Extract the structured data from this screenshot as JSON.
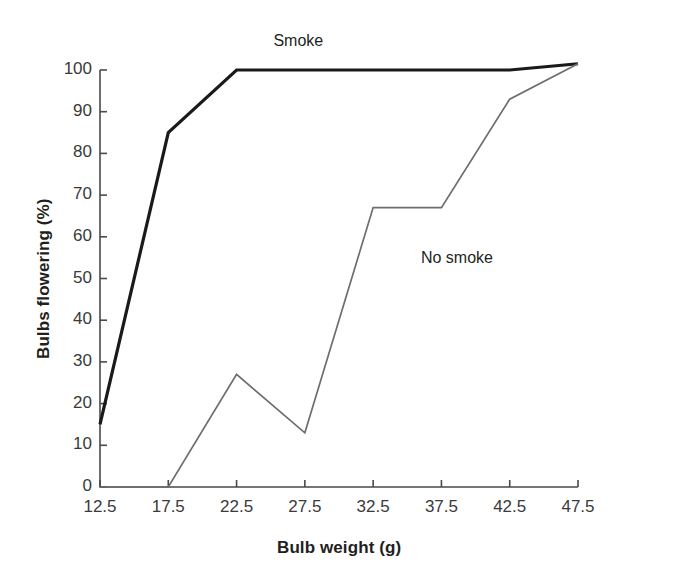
{
  "chart_data": {
    "type": "line",
    "title": "",
    "xlabel": "Bulb weight (g)",
    "ylabel": "Bulbs flowering (%)",
    "xlim": [
      12.5,
      47.5
    ],
    "ylim": [
      0,
      100
    ],
    "x": [
      12.5,
      17.5,
      22.5,
      27.5,
      32.5,
      37.5,
      42.5,
      47.5
    ],
    "xtick_labels": [
      "12.5",
      "17.5",
      "22.5",
      "27.5",
      "32.5",
      "37.5",
      "42.5",
      "47.5"
    ],
    "ytick_labels": [
      "0",
      "10",
      "20",
      "30",
      "40",
      "50",
      "60",
      "70",
      "80",
      "90",
      "100"
    ],
    "yticks": [
      0,
      10,
      20,
      30,
      40,
      50,
      60,
      70,
      80,
      90,
      100
    ],
    "grid": false,
    "legend_position": "inline-annotations",
    "series": [
      {
        "name": "Smoke",
        "color": "#1a1a1a",
        "width": 3.2,
        "values": [
          15,
          85,
          100,
          100,
          100,
          100,
          100,
          101.5
        ]
      },
      {
        "name": "No smoke",
        "color": "#6d6d70",
        "width": 1.7,
        "values": [
          0,
          0,
          27,
          13,
          67,
          67,
          93,
          101.5
        ]
      }
    ],
    "annotations": [
      {
        "text": "Smoke",
        "x": 25.2,
        "y": 107
      },
      {
        "text": "No smoke",
        "x": 36.0,
        "y": 55
      }
    ]
  },
  "axis": {
    "line_color": "#4a4a4c",
    "tick_length": 7
  }
}
